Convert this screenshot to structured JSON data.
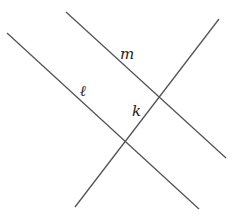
{
  "diagram": {
    "title": "",
    "lines": [
      {
        "id": "l",
        "label": "ℓ",
        "x1": 7,
        "y1": 33,
        "x2": 199,
        "y2": 209,
        "label_x": 80,
        "label_y": 96
      },
      {
        "id": "m",
        "label": "m",
        "x1": 66,
        "y1": 12,
        "x2": 226,
        "y2": 158,
        "label_x": 120,
        "label_y": 59
      },
      {
        "id": "k",
        "label": "k",
        "x1": 219,
        "y1": 19,
        "x2": 75,
        "y2": 207,
        "label_x": 132,
        "label_y": 116
      }
    ],
    "stroke_color": "#555555",
    "label_color": "#222222"
  }
}
